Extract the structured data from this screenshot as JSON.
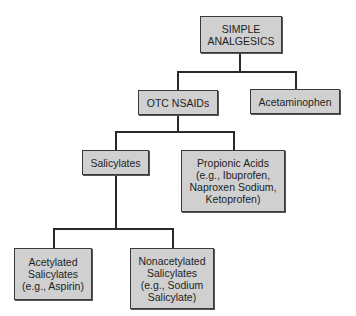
{
  "diagram": {
    "type": "hierarchy",
    "nodes": {
      "root": {
        "label": "SIMPLE\nANALGESICS"
      },
      "otc_nsaids": {
        "label": "OTC NSAIDs"
      },
      "acetaminophen": {
        "label": "Acetaminophen"
      },
      "salicylates": {
        "label": "Salicylates"
      },
      "propionic_acids": {
        "label": "Propionic Acids\n(e.g., Ibuprofen,\nNaproxen Sodium,\nKetoprofen)"
      },
      "acetylated": {
        "label": "Acetylated\nSalicylates\n(e.g., Aspirin)"
      },
      "nonacetylated": {
        "label": "Nonacetylated\nSalicylates\n(e.g., Sodium\nSalicylate)"
      }
    },
    "edges": [
      [
        "root",
        "otc_nsaids"
      ],
      [
        "root",
        "acetaminophen"
      ],
      [
        "otc_nsaids",
        "salicylates"
      ],
      [
        "otc_nsaids",
        "propionic_acids"
      ],
      [
        "salicylates",
        "acetylated"
      ],
      [
        "salicylates",
        "nonacetylated"
      ]
    ],
    "colors": {
      "box_fill": "#d0d0d0",
      "box_border": "#3a3a3a",
      "connector": "#2a2a2a"
    }
  }
}
